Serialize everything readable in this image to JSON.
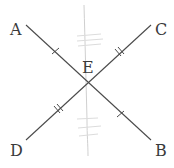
{
  "diagram": {
    "points": {
      "A": {
        "label": "A",
        "x": 26,
        "y": 25
      },
      "B": {
        "label": "B",
        "x": 151,
        "y": 140
      },
      "C": {
        "label": "C",
        "x": 151,
        "y": 25
      },
      "D": {
        "label": "D",
        "x": 26,
        "y": 140
      },
      "E": {
        "label": "E",
        "x": 88,
        "y": 83
      }
    },
    "segments": [
      {
        "name": "AB",
        "from": "A",
        "to": "B"
      },
      {
        "name": "CD",
        "from": "C",
        "to": "D"
      }
    ],
    "congruence_marks": [
      {
        "segment": "AE",
        "ticks": 1
      },
      {
        "segment": "EB",
        "ticks": 1
      },
      {
        "segment": "CE",
        "ticks": 2
      },
      {
        "segment": "ED",
        "ticks": 2
      }
    ],
    "colors": {
      "line": "#4a4a4a",
      "label": "#3a3a3a",
      "faint_background_marks": "#c9c9c9"
    }
  }
}
